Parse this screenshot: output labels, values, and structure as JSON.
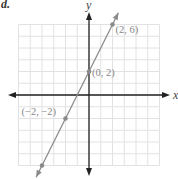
{
  "problem": {
    "label": "d."
  },
  "chart_data": {
    "type": "line",
    "title": "",
    "xlabel": "x",
    "ylabel": "y",
    "xlim": [
      -6,
      6
    ],
    "ylim": [
      -6,
      6
    ],
    "grid": true,
    "grid_step": 1,
    "series": [
      {
        "name": "y = 2x + 2",
        "slope": 2,
        "intercept": 2,
        "line_extends": [
          [
            -4.5,
            -7
          ],
          [
            2.5,
            7
          ]
        ],
        "points": [
          {
            "x": 2,
            "y": 6,
            "label": "(2, 6)"
          },
          {
            "x": 0,
            "y": 2,
            "label": "(0, 2)"
          },
          {
            "x": -2,
            "y": -2,
            "label": "(−2, −2)"
          },
          {
            "x": -4,
            "y": -6,
            "label": ""
          }
        ]
      }
    ],
    "colors": {
      "grid": "#e2e2e2",
      "axes": "#222222",
      "line": "#8a8a8a",
      "points": "#8a8a8a",
      "labels": "#888888"
    }
  }
}
